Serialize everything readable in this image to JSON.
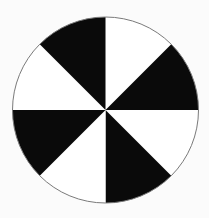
{
  "figure": {
    "name": "alternating-sector-disc",
    "background_color": "#fbfbfb",
    "canvas": {
      "width": 209,
      "height": 218
    }
  },
  "chart_data": {
    "type": "pie",
    "title": "",
    "subtitle": "",
    "xlabel": "",
    "ylabel": "",
    "legend": [],
    "annotations": [],
    "grid": false,
    "labels_shown": false,
    "slice_count": 8,
    "slice_angle_degrees": 45,
    "start_angle_degrees": 0,
    "direction": "clockwise",
    "categories": [
      "sector-1",
      "sector-2",
      "sector-3",
      "sector-4",
      "sector-5",
      "sector-6",
      "sector-7",
      "sector-8"
    ],
    "values": [
      12.5,
      12.5,
      12.5,
      12.5,
      12.5,
      12.5,
      12.5,
      12.5
    ],
    "slices": [
      {
        "index": 0,
        "start_deg": 0,
        "end_deg": 45,
        "fill": "#ffffff"
      },
      {
        "index": 1,
        "start_deg": 45,
        "end_deg": 90,
        "fill": "#0a0a0a"
      },
      {
        "index": 2,
        "start_deg": 90,
        "end_deg": 135,
        "fill": "#ffffff"
      },
      {
        "index": 3,
        "start_deg": 135,
        "end_deg": 180,
        "fill": "#0a0a0a"
      },
      {
        "index": 4,
        "start_deg": 180,
        "end_deg": 225,
        "fill": "#ffffff"
      },
      {
        "index": 5,
        "start_deg": 225,
        "end_deg": 270,
        "fill": "#0a0a0a"
      },
      {
        "index": 6,
        "start_deg": 270,
        "end_deg": 315,
        "fill": "#ffffff"
      },
      {
        "index": 7,
        "start_deg": 315,
        "end_deg": 360,
        "fill": "#0a0a0a"
      }
    ],
    "geometry": {
      "center_x": 105.5,
      "center_y": 110,
      "radius": 93
    },
    "colors": {
      "fill_dark": "#0a0a0a",
      "fill_light": "#ffffff",
      "outline": "#7a7a7a",
      "background": "#fbfbfb"
    },
    "outline_width": 1
  }
}
